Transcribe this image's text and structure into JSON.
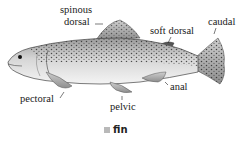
{
  "diagram": {
    "labels": {
      "spinous_dorsal_line1": "spinous",
      "spinous_dorsal_line2": "dorsal",
      "soft_dorsal": "soft dorsal",
      "caudal": "caudal",
      "pectoral": "pectoral",
      "pelvic": "pelvic",
      "anal": "anal"
    },
    "caption": {
      "term": "fin",
      "marker_color": "#b9b9b9"
    }
  }
}
